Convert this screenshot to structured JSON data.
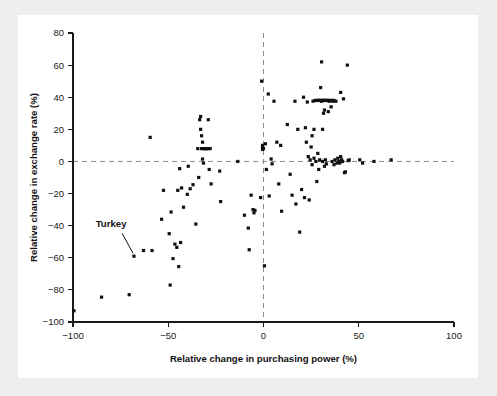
{
  "figure": {
    "background_color": "#eeeeee",
    "card_color": "#ffffff",
    "point_color": "#111111",
    "axis_color": "#1a1a1a",
    "zero_line_color": "#8c8c8c"
  },
  "chart_data": {
    "type": "scatter",
    "title": "",
    "subtitle": "",
    "xlabel": "Relative change in purchasing power (%)",
    "ylabel": "Relative change in exchange rate (%)",
    "xlim": [
      -100,
      100
    ],
    "ylim": [
      -100,
      80
    ],
    "xticks": [
      -100,
      -50,
      0,
      50,
      100
    ],
    "yticks": [
      -100,
      -80,
      -60,
      -40,
      -20,
      0,
      20,
      40,
      60,
      80
    ],
    "xtick_labels": [
      "−100",
      "−50",
      "0",
      "50",
      "100"
    ],
    "ytick_labels": [
      "−100",
      "−80",
      "−60",
      "−40",
      "−20",
      "0",
      "20",
      "40",
      "60",
      "80"
    ],
    "grid": false,
    "legend": null,
    "reference_lines": [
      {
        "axis": "y",
        "value": 0,
        "style": "dashed"
      },
      {
        "axis": "x",
        "value": 0,
        "style": "dashed"
      }
    ],
    "annotations": [
      {
        "text": "Turkey",
        "label_x": -80,
        "label_y": -41,
        "point_x": -68,
        "point_y": -59
      }
    ],
    "points": [
      [
        -99.5,
        -93
      ],
      [
        -85,
        -84.5
      ],
      [
        -70.5,
        -83
      ],
      [
        -68,
        -59
      ],
      [
        -63,
        -55.5
      ],
      [
        -59.5,
        15
      ],
      [
        -58.5,
        -55.5
      ],
      [
        -53.5,
        -36
      ],
      [
        -52.5,
        -18
      ],
      [
        -49.5,
        -45
      ],
      [
        -49,
        -77
      ],
      [
        -48.5,
        -31.5
      ],
      [
        -47.5,
        -60.5
      ],
      [
        -46.5,
        -51.5
      ],
      [
        -45.5,
        -53.5
      ],
      [
        -45,
        -18
      ],
      [
        -44.5,
        -65.5
      ],
      [
        -44,
        -4.5
      ],
      [
        -43.5,
        -50.5
      ],
      [
        -43,
        -16.5
      ],
      [
        -42,
        -28.5
      ],
      [
        -40,
        -20.5
      ],
      [
        -39.5,
        -3
      ],
      [
        -38.5,
        -17
      ],
      [
        -37,
        -14.5
      ],
      [
        -35.5,
        -39
      ],
      [
        -34.5,
        8
      ],
      [
        -34,
        -10
      ],
      [
        -33.5,
        26
      ],
      [
        -33,
        28
      ],
      [
        -33,
        20
      ],
      [
        -32.5,
        16
      ],
      [
        -32.5,
        8
      ],
      [
        -32,
        12
      ],
      [
        -32,
        1.5
      ],
      [
        -31.5,
        -1
      ],
      [
        -31.5,
        8
      ],
      [
        -31,
        8
      ],
      [
        -30.5,
        8
      ],
      [
        -30,
        8
      ],
      [
        -29.5,
        8
      ],
      [
        -29,
        8
      ],
      [
        -29,
        26
      ],
      [
        -28.5,
        -5
      ],
      [
        -28,
        8
      ],
      [
        -27.5,
        -14
      ],
      [
        -23,
        -6
      ],
      [
        -22.5,
        -25
      ],
      [
        -13.5,
        0
      ],
      [
        -10,
        -33.5
      ],
      [
        -8,
        -41.5
      ],
      [
        -7.5,
        -55
      ],
      [
        -6.5,
        -21
      ],
      [
        -5.5,
        -30
      ],
      [
        -5,
        -32
      ],
      [
        -4.5,
        -30.5
      ],
      [
        -1.5,
        -22.5
      ],
      [
        -1,
        50
      ],
      [
        -0.5,
        9
      ],
      [
        -0.5,
        7.5
      ],
      [
        -0.5,
        10
      ],
      [
        0,
        8
      ],
      [
        0.5,
        -65
      ],
      [
        1,
        11
      ],
      [
        1.5,
        -5
      ],
      [
        2.5,
        42
      ],
      [
        3,
        -21.5
      ],
      [
        4,
        1.5
      ],
      [
        4.5,
        -1.5
      ],
      [
        5.5,
        37.5
      ],
      [
        7,
        12
      ],
      [
        8,
        -14
      ],
      [
        9,
        10
      ],
      [
        9.5,
        -31
      ],
      [
        12.5,
        23
      ],
      [
        14,
        -8
      ],
      [
        15,
        -21
      ],
      [
        16.5,
        37.5
      ],
      [
        17,
        -26.5
      ],
      [
        18,
        20
      ],
      [
        19,
        -44
      ],
      [
        20,
        -17.5
      ],
      [
        21,
        40
      ],
      [
        21.5,
        -22.5
      ],
      [
        22,
        21
      ],
      [
        22.5,
        12
      ],
      [
        23,
        37
      ],
      [
        23.5,
        3
      ],
      [
        24,
        -24
      ],
      [
        24.5,
        1
      ],
      [
        25,
        9
      ],
      [
        25.5,
        -2
      ],
      [
        25.5,
        16
      ],
      [
        26,
        37.5
      ],
      [
        26.5,
        2
      ],
      [
        26.5,
        20
      ],
      [
        27,
        38
      ],
      [
        27.5,
        0
      ],
      [
        28,
        38
      ],
      [
        28,
        -12.5
      ],
      [
        28.5,
        38
      ],
      [
        28.5,
        5
      ],
      [
        29,
        38
      ],
      [
        29,
        -5
      ],
      [
        29.5,
        38
      ],
      [
        29.5,
        1
      ],
      [
        30,
        38
      ],
      [
        30,
        46
      ],
      [
        30.5,
        37.5
      ],
      [
        30.5,
        62
      ],
      [
        31,
        38
      ],
      [
        31,
        20
      ],
      [
        31,
        0
      ],
      [
        31.5,
        38
      ],
      [
        31.5,
        30
      ],
      [
        32,
        38
      ],
      [
        32,
        32
      ],
      [
        32,
        -3
      ],
      [
        32.5,
        38
      ],
      [
        32.5,
        1
      ],
      [
        33,
        38
      ],
      [
        33,
        -1.5
      ],
      [
        33.5,
        38
      ],
      [
        34,
        38
      ],
      [
        34,
        31
      ],
      [
        34.5,
        37.5
      ],
      [
        35,
        38
      ],
      [
        35.5,
        34
      ],
      [
        36,
        38
      ],
      [
        36,
        0
      ],
      [
        36.5,
        37.5
      ],
      [
        37,
        38
      ],
      [
        37,
        -2
      ],
      [
        37.5,
        1
      ],
      [
        38,
        37.5
      ],
      [
        38.5,
        -1
      ],
      [
        39,
        2
      ],
      [
        39.5,
        0
      ],
      [
        40,
        -1
      ],
      [
        40.5,
        3
      ],
      [
        40.5,
        43
      ],
      [
        41,
        1
      ],
      [
        41.5,
        0
      ],
      [
        42,
        39
      ],
      [
        42.5,
        -7
      ],
      [
        43,
        -6.5
      ],
      [
        44,
        60
      ],
      [
        44.5,
        0.5
      ],
      [
        45,
        1
      ],
      [
        50.5,
        1
      ],
      [
        52,
        -1
      ],
      [
        58,
        0
      ],
      [
        67,
        1
      ]
    ]
  }
}
